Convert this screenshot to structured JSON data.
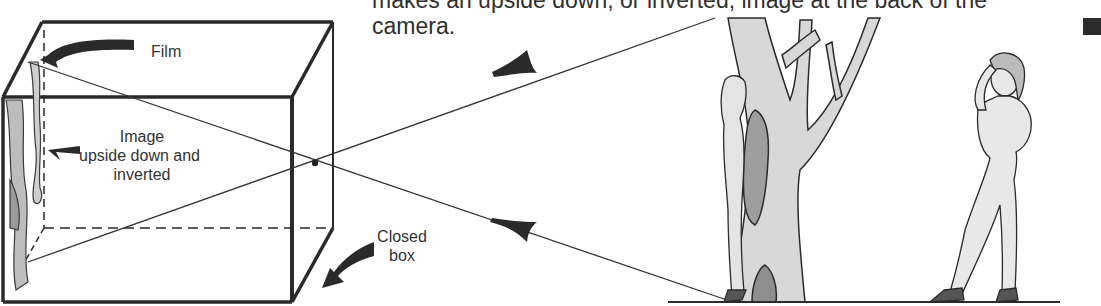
{
  "caption": {
    "line1": "makes an upside down, or inverted, image at the back of the",
    "line2": "camera."
  },
  "labels": {
    "film": "Film",
    "image_line1": "Image",
    "image_line2": "upside down and",
    "image_line3": "inverted",
    "closed_line1": "Closed",
    "closed_line2": "box"
  },
  "figures": {
    "tree": "tree-illustration",
    "person_hiding": "person-behind-tree",
    "person_standing": "person-standing"
  },
  "colors": {
    "ink": "#2a2a2a",
    "background": "#ffffff"
  }
}
